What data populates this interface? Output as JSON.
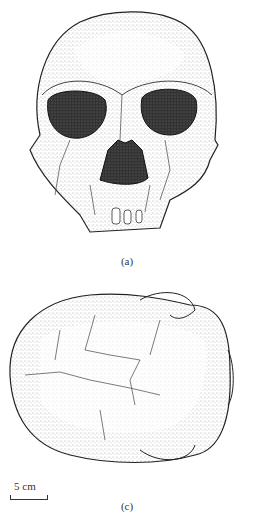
{
  "figure": {
    "panels": [
      {
        "id": "a",
        "label": "(a)",
        "description": "Frontal view of fossil hominin skull, stippled ink drawing"
      },
      {
        "id": "c",
        "label": "(c)",
        "description": "Superior (top-down) view of fossil hominin skull, stippled ink drawing"
      }
    ],
    "scale_bar": {
      "label": "5 cm"
    }
  }
}
